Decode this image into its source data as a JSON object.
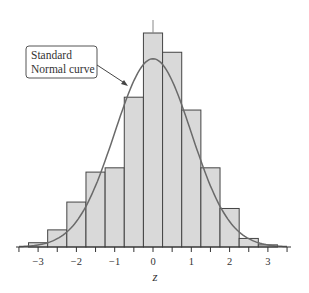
{
  "chart_data": {
    "type": "bar",
    "title": "",
    "xlabel": "z",
    "ylabel": "",
    "xlim": [
      -3.5,
      3.5
    ],
    "bin_width": 0.5,
    "bins": [
      {
        "from": -3.25,
        "to": -2.75,
        "height": 0.02
      },
      {
        "from": -2.75,
        "to": -2.25,
        "height": 0.08
      },
      {
        "from": -2.25,
        "to": -1.75,
        "height": 0.21
      },
      {
        "from": -1.75,
        "to": -1.25,
        "height": 0.35
      },
      {
        "from": -1.25,
        "to": -0.75,
        "height": 0.37
      },
      {
        "from": -0.75,
        "to": -0.25,
        "height": 0.7
      },
      {
        "from": -0.25,
        "to": 0.25,
        "height": 1.0
      },
      {
        "from": 0.25,
        "to": 0.75,
        "height": 0.91
      },
      {
        "from": 0.75,
        "to": 1.25,
        "height": 0.64
      },
      {
        "from": 1.25,
        "to": 1.75,
        "height": 0.37
      },
      {
        "from": 1.75,
        "to": 2.25,
        "height": 0.18
      },
      {
        "from": 2.25,
        "to": 2.75,
        "height": 0.04
      },
      {
        "from": 2.75,
        "to": 3.25,
        "height": 0.01
      }
    ],
    "x_ticks": [
      -3,
      -2,
      -1,
      0,
      1,
      2,
      3
    ],
    "x_tick_labels": [
      "−3",
      "−2",
      "−1",
      "0",
      "1",
      "2",
      "3"
    ],
    "minor_ticks_step": 0.5,
    "overlay_curve": {
      "name": "Standard Normal curve",
      "mean": 0,
      "sd": 1,
      "peak_height": 0.88
    },
    "annotation": {
      "line1": "Standard",
      "line2": "Normal curve"
    },
    "grid": false,
    "legend": "none",
    "colors": {
      "bar_fill": "#d9d9d9",
      "bar_edge": "#444444",
      "curve": "#6a6a6a",
      "axis": "#333333"
    }
  }
}
